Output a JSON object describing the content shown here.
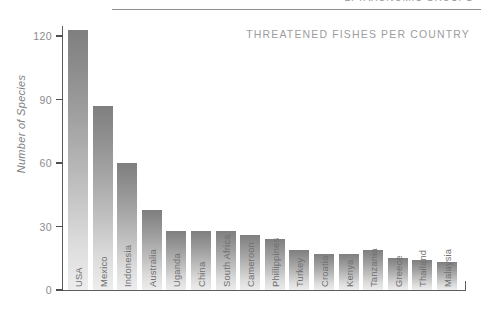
{
  "header": {
    "cut_off_text": "2. TAXONOMIC GROUPS",
    "rule": "horizontal-rule"
  },
  "chart_data": {
    "type": "bar",
    "title": "THREATENED FISHES PER COUNTRY",
    "xlabel": "",
    "ylabel": "Number of Species",
    "ylim": [
      0,
      130
    ],
    "yticks": [
      0,
      30,
      60,
      90,
      120
    ],
    "ytick_labels": [
      "0",
      "30",
      "60",
      "90",
      "120"
    ],
    "grid": false,
    "legend": null,
    "categories": [
      "USA",
      "Mexico",
      "Indonesia",
      "Australia",
      "Uganda",
      "China",
      "South Africa",
      "Cameroon",
      "Phillippines",
      "Turkey",
      "Croatia",
      "Kenya",
      "Tanzania",
      "Greece",
      "Thailand",
      "Malaysia"
    ],
    "values": [
      123,
      87,
      60,
      38,
      28,
      28,
      28,
      26,
      24,
      19,
      17,
      17,
      19,
      15,
      14,
      13
    ]
  },
  "colors": {
    "bar_top": "#7f7f7f",
    "bar_bottom": "#ededed",
    "axis": "#5d5d5d",
    "tick_text": "#8b8b8b",
    "title_text": "#9d9d9d",
    "label_text": "#6f6f6f"
  }
}
